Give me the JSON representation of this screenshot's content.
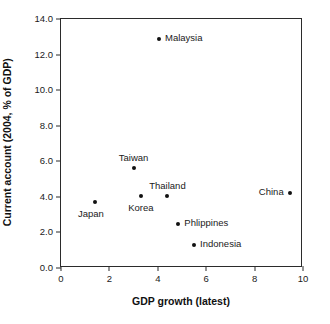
{
  "chart_data": {
    "type": "scatter",
    "title": "",
    "xlabel": "GDP growth (latest)",
    "ylabel": "Current account (2004, % of GDP)",
    "xlim": [
      0,
      10
    ],
    "ylim": [
      0,
      14
    ],
    "xticks": [
      "0",
      "2",
      "4",
      "6",
      "8",
      "10"
    ],
    "xtick_values": [
      0,
      2,
      4,
      6,
      8,
      10
    ],
    "yticks": [
      "0.0",
      "2.0",
      "4.0",
      "6.0",
      "8.0",
      "10.0",
      "12.0",
      "14.0"
    ],
    "ytick_values": [
      0,
      2,
      4,
      6,
      8,
      10,
      12,
      14
    ],
    "grid": false,
    "legend": "none",
    "marker_color": "#111111",
    "axis_color": "#2b2b2b",
    "points": [
      {
        "label": "Japan",
        "x": 1.4,
        "y": 3.7,
        "label_pos": "below-left"
      },
      {
        "label": "Taiwan",
        "x": 3.0,
        "y": 5.6,
        "label_pos": "above"
      },
      {
        "label": "Korea",
        "x": 3.3,
        "y": 4.05,
        "label_pos": "below"
      },
      {
        "label": "Malaysia",
        "x": 4.05,
        "y": 12.85,
        "label_pos": "right"
      },
      {
        "label": "Thailand",
        "x": 4.4,
        "y": 4.05,
        "label_pos": "above"
      },
      {
        "label": "Phlippines",
        "x": 4.85,
        "y": 2.45,
        "label_pos": "right"
      },
      {
        "label": "Indonesia",
        "x": 5.5,
        "y": 1.3,
        "label_pos": "right"
      },
      {
        "label": "China",
        "x": 9.45,
        "y": 4.2,
        "label_pos": "left"
      }
    ]
  }
}
